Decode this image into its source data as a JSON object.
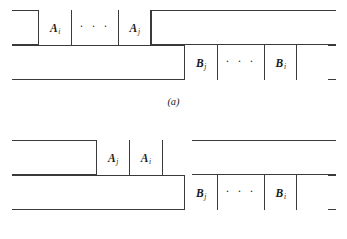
{
  "figure": {
    "panels": [
      {
        "id": "a",
        "caption": "(a)",
        "rows": [
          {
            "id": "a-upper",
            "cells": [
              {
                "label": "A",
                "sub": "i",
                "kind": "label"
              },
              {
                "label": "· · ·",
                "sub": "",
                "kind": "ellipsis"
              },
              {
                "label": "A",
                "sub": "j",
                "kind": "label"
              },
              {
                "label": "",
                "sub": "",
                "kind": "blank"
              }
            ]
          },
          {
            "id": "a-lower",
            "cells": [
              {
                "label": "B",
                "sub": "j",
                "kind": "label"
              },
              {
                "label": "· · ·",
                "sub": "",
                "kind": "ellipsis"
              },
              {
                "label": "B",
                "sub": "i",
                "kind": "label"
              },
              {
                "label": "",
                "sub": "",
                "kind": "blank"
              }
            ]
          }
        ]
      },
      {
        "id": "b",
        "caption": "(b)",
        "rows": [
          {
            "id": "b-upper",
            "cells": [
              {
                "label": "A",
                "sub": "j",
                "kind": "label"
              },
              {
                "label": "A",
                "sub": "i",
                "kind": "label"
              },
              {
                "label": "",
                "sub": "",
                "kind": "blank"
              }
            ]
          },
          {
            "id": "b-lower",
            "cells": [
              {
                "label": "B",
                "sub": "j",
                "kind": "label"
              },
              {
                "label": "· · ·",
                "sub": "",
                "kind": "ellipsis"
              },
              {
                "label": "B",
                "sub": "i",
                "kind": "label"
              },
              {
                "label": "",
                "sub": "",
                "kind": "blank"
              }
            ]
          }
        ]
      }
    ],
    "colors": {
      "line": "#3a3a3a",
      "text": "#1a1a1a",
      "background": "#ffffff"
    }
  }
}
